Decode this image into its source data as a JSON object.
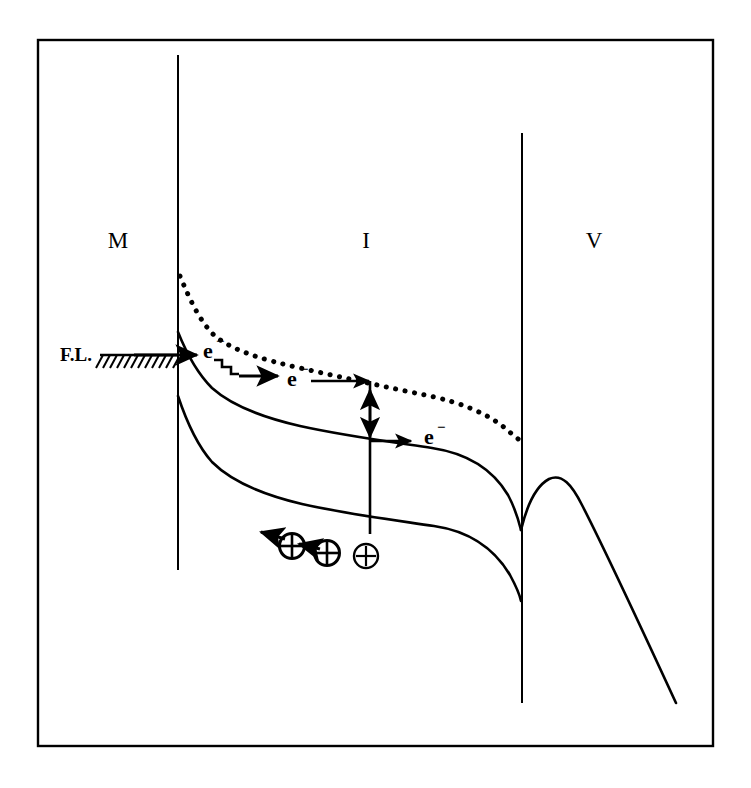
{
  "figure": {
    "background_color": "#ffffff",
    "ink_color": "#000000",
    "frame": {
      "x": 38,
      "y": 40,
      "width": 675,
      "height": 706,
      "stroke_width": 2.4
    }
  },
  "regions": [
    {
      "id": "metal",
      "label": "M",
      "label_x": 118,
      "label_y": 248,
      "description": "Metal electrode"
    },
    {
      "id": "insulator",
      "label": "I",
      "label_x": 366,
      "label_y": 248,
      "description": "Insulator layer"
    },
    {
      "id": "vacuum",
      "label": "V",
      "label_x": 594,
      "label_y": 248,
      "description": "Vacuum"
    }
  ],
  "interfaces": [
    {
      "id": "metal-insulator",
      "x": 178,
      "y_top": 55,
      "y_bottom": 570,
      "stroke_width": 2.0
    },
    {
      "id": "insulator-vacuum",
      "x": 522,
      "y_top": 133,
      "y_bottom": 703,
      "stroke_width": 2.0
    }
  ],
  "fermi_level": {
    "label": "F.L.",
    "label_x": 60,
    "label_y": 361,
    "line_y": 355,
    "line_x_start": 100,
    "line_x_end": 178,
    "hatch_count": 11,
    "hatch_length": 13,
    "hatch_angle_deg": 55
  },
  "bands": {
    "conduction_dotted": {
      "id": "insulator-conduction-band",
      "style": "dotted",
      "dot_radius": 2.6,
      "dot_spacing": 9.5,
      "path": "M 180,276 C 190,300 200,322 215,336 C 235,352 265,360 300,368 C 345,378 390,388 430,396 C 462,403 488,414 505,428 C 513,435 518,439 521,441"
    },
    "conduction_solid": {
      "id": "insulator-conduction-edge",
      "style": "solid",
      "stroke_width": 2.6,
      "path": "M 178,332 C 186,352 196,372 212,388 C 232,406 265,418 300,426 C 345,436 392,442 432,448 C 465,453 492,468 508,495 C 515,508 519,522 521,530"
    },
    "valence_solid": {
      "id": "insulator-valence-edge",
      "style": "solid",
      "stroke_width": 2.6,
      "path": "M 178,396 C 186,420 196,444 212,462 C 234,484 268,496 302,504 C 346,514 394,520 434,526 C 468,531 494,548 510,575 C 517,588 520,596 521,601"
    },
    "vacuum_barrier": {
      "id": "vacuum-barrier-image-potential",
      "style": "solid",
      "stroke_width": 2.6,
      "peak_x": 551,
      "peak_y": 479,
      "path": "M 521,530 C 527,505 536,486 549,479 C 562,473 572,485 582,505 C 600,540 640,625 676,703"
    }
  },
  "carriers": [
    {
      "id": "electron-injected",
      "symbol": "e",
      "superscript": "−",
      "label_x": 203,
      "label_y": 358,
      "description": "Electron injected from metal Fermi level"
    },
    {
      "id": "electron-hopping",
      "symbol": "e",
      "superscript": "−",
      "label_x": 287,
      "label_y": 386,
      "description": "Electron hopping through insulator trap states"
    },
    {
      "id": "electron-emitted",
      "symbol": "e",
      "superscript": "−",
      "label_x": 432,
      "label_y": 444,
      "description": "Electron drifting in the conduction band toward vacuum"
    }
  ],
  "holes": [
    {
      "id": "hole-left",
      "cx": 292,
      "cy": 546,
      "r": 12,
      "symbol": "⊕"
    },
    {
      "id": "hole-middle",
      "cx": 327,
      "cy": 553,
      "r": 12,
      "symbol": "⊕"
    },
    {
      "id": "hole-right",
      "cx": 366,
      "cy": 556,
      "r": 12,
      "symbol": "⊕"
    }
  ],
  "arrows": [
    {
      "id": "injection-arrow",
      "direction": "right",
      "x1": 134,
      "y1": 355,
      "x2": 198,
      "y2": 355,
      "description": "Electron injection across the metal-insulator interface"
    },
    {
      "id": "hop-arrow",
      "direction": "right",
      "x1": 238,
      "y1": 376,
      "x2": 278,
      "y2": 376,
      "description": "Hopping step to the right"
    },
    {
      "id": "transport-arrow",
      "direction": "right",
      "x1": 308,
      "y1": 381,
      "x2": 370,
      "y2": 381,
      "description": "Electron transport in the upper band"
    },
    {
      "id": "recombination-down-arrow",
      "direction": "down",
      "x1": 370,
      "y1": 381,
      "x2": 370,
      "y2": 437,
      "description": "Electron relaxes down to the conduction edge"
    },
    {
      "id": "emission-arrow",
      "direction": "right",
      "x1": 370,
      "y1": 441,
      "x2": 412,
      "y2": 441,
      "description": "Electron continues toward vacuum"
    },
    {
      "id": "hole-injection-arrow",
      "direction": "up",
      "x1": 370,
      "y1": 534,
      "x2": 370,
      "y2": 389,
      "description": "Hole excitation upward"
    },
    {
      "id": "hole-drift-arrow-1",
      "direction": "left",
      "x1": 283,
      "y1": 538,
      "x2": 258,
      "y2": 532,
      "description": "Hole drifts toward the metal"
    },
    {
      "id": "hole-drift-arrow-2",
      "direction": "left",
      "x1": 318,
      "y1": 548,
      "x2": 300,
      "y2": 543,
      "description": "Hole drifts toward the metal"
    }
  ],
  "hopping_staircase": {
    "id": "trap-hopping-staircase",
    "description": "Stair-step path representing trap-assisted hopping",
    "points": "214,360 222,360 222,367 231,367 231,374 239,374",
    "stroke_width": 2.6
  }
}
